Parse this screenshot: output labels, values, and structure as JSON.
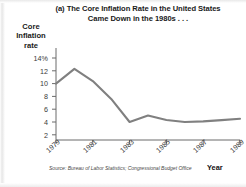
{
  "figure": {
    "panel_label": "(a)",
    "title_line1": "(a) The Core Inflation Rate in the United States",
    "title_line2": "Came Down in the 1980s . . .",
    "y_axis_title_line1": "Core",
    "y_axis_title_line2": "Inflation",
    "y_axis_title_line3": "rate",
    "x_axis_title": "Year",
    "source_note": "Source: Bureau of Labor Statistics; Congressional Budget Office",
    "line_color": "#808080",
    "axis_color": "#6b6b6b",
    "text_color": "#1a1a1a",
    "background_color": "#ffffff"
  },
  "chart_data": {
    "type": "line",
    "title": "(a) The Core Inflation Rate in the United States Came Down in the 1980s . . .",
    "xlabel": "Year",
    "ylabel": "Core Inflation rate",
    "x": [
      1979,
      1980,
      1981,
      1982,
      1983,
      1984,
      1985,
      1986,
      1987,
      1988,
      1989
    ],
    "values": [
      10.0,
      12.3,
      10.4,
      7.6,
      4.0,
      5.0,
      4.3,
      4.0,
      4.1,
      4.3,
      4.5
    ],
    "series": [
      {
        "name": "Core inflation rate",
        "values": [
          10.0,
          12.3,
          10.4,
          7.6,
          4.0,
          5.0,
          4.3,
          4.0,
          4.1,
          4.3,
          4.5
        ]
      }
    ],
    "xlim": [
      1979,
      1989
    ],
    "ylim": [
      0,
      15
    ],
    "x_tick_labels": [
      "1979",
      "1981",
      "1983",
      "1985",
      "1987",
      "1989"
    ],
    "x_tick_values": [
      1979,
      1981,
      1983,
      1985,
      1987,
      1989
    ],
    "y_tick_labels": [
      "14%",
      "12",
      "10",
      "8",
      "6",
      "4",
      "2"
    ],
    "y_tick_values": [
      14,
      12,
      10,
      8,
      6,
      4,
      2
    ],
    "grid": false,
    "legend": "none",
    "units": "percent"
  }
}
